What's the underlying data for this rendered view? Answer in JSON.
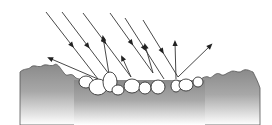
{
  "diagram": {
    "subject": "diffuse reflection of light rays off a rough pebbly surface",
    "colors": {
      "background": "#ffffff",
      "ground_top": "#8c8c8c",
      "ground_bottom": "#ffffff",
      "stroke": "#333333",
      "pebble_fill": "#ffffff"
    },
    "incident_rays": [
      {
        "x1": 46,
        "y1": 12,
        "x2": 98,
        "y2": 79,
        "arrow_at": 0.5
      },
      {
        "x1": 62,
        "y1": 12,
        "x2": 109,
        "y2": 74,
        "arrow_at": 0.55
      },
      {
        "x1": 83,
        "y1": 13,
        "x2": 131,
        "y2": 77,
        "arrow_at": 0.45
      },
      {
        "x1": 110,
        "y1": 13,
        "x2": 153,
        "y2": 73,
        "arrow_at": 0.5
      },
      {
        "x1": 125,
        "y1": 18,
        "x2": 164,
        "y2": 79,
        "arrow_at": 0.5
      },
      {
        "x1": 143,
        "y1": 20,
        "x2": 178,
        "y2": 77,
        "arrow_at": 0.55
      }
    ],
    "reflected_rays": [
      {
        "x1": 98,
        "y1": 79,
        "x2": 49,
        "y2": 58
      },
      {
        "x1": 109,
        "y1": 74,
        "x2": 103,
        "y2": 37
      },
      {
        "x1": 131,
        "y1": 77,
        "x2": 122,
        "y2": 57
      },
      {
        "x1": 153,
        "y1": 73,
        "x2": 145,
        "y2": 45
      },
      {
        "x1": 176,
        "y1": 79,
        "x2": 175,
        "y2": 42
      },
      {
        "x1": 178,
        "y1": 77,
        "x2": 211,
        "y2": 45
      }
    ],
    "pebbles": [
      {
        "cx": 86,
        "cy": 82,
        "rx": 7,
        "ry": 6
      },
      {
        "cx": 98,
        "cy": 87,
        "rx": 9,
        "ry": 8
      },
      {
        "cx": 110,
        "cy": 82,
        "rx": 7,
        "ry": 10
      },
      {
        "cx": 118,
        "cy": 90,
        "rx": 6,
        "ry": 5
      },
      {
        "cx": 132,
        "cy": 86,
        "rx": 8,
        "ry": 7
      },
      {
        "cx": 145,
        "cy": 88,
        "rx": 6,
        "ry": 6
      },
      {
        "cx": 158,
        "cy": 87,
        "rx": 7,
        "ry": 7
      },
      {
        "cx": 176,
        "cy": 86,
        "rx": 5,
        "ry": 6
      },
      {
        "cx": 186,
        "cy": 85,
        "rx": 7,
        "ry": 6
      },
      {
        "cx": 198,
        "cy": 82,
        "rx": 5,
        "ry": 5
      }
    ],
    "ground_left_path": "M20,72 C24,68 28,70 31,67 C34,64 38,68 42,66 C46,63 50,67 54,65 C57,62 60,68 64,73 C67,78 70,72 74,76 C77,80 80,78 82,80 L90,125 L20,125 Z",
    "ground_right_path": "M200,80 C204,76 208,76 210,78 C214,76 216,72 220,74 C224,77 226,73 230,72 C234,69 238,74 242,71 C246,68 250,71 253,72 C256,78 258,82 260,88 L260,125 L195,125 Z",
    "ground_bottom_path": "M20,125 L20,100 C60,96 120,100 200,96 L260,92 L260,125 Z"
  }
}
